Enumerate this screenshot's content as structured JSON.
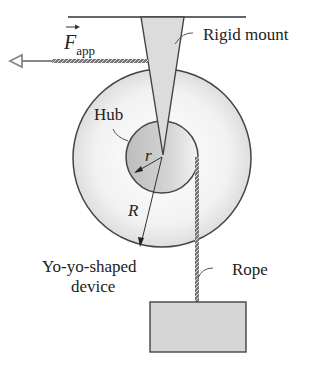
{
  "diagram": {
    "labels": {
      "force": "F",
      "force_subscript": "app",
      "mount": "Rigid mount",
      "hub": "Hub",
      "small_radius": "r",
      "large_radius": "R",
      "device_line1": "Yo-yo-shaped",
      "device_line2": "device",
      "rope": "Rope"
    },
    "colors": {
      "line": "#333333",
      "disk_fill": "#ececec",
      "hub_fill": "#c8c8c8",
      "mount_fill": "#dcdcdc",
      "block_fill": "#d6d6d6",
      "arrow": "#888888"
    }
  }
}
